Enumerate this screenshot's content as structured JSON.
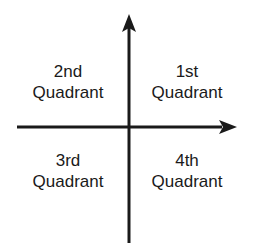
{
  "diagram": {
    "background_color": "#ffffff",
    "stroke_color": "#1a1a1a",
    "text_color": "#1a1a1a"
  },
  "axes": {
    "vertical": {
      "name": "y-axis",
      "arrow_direction": "up",
      "x": 129,
      "top": 14,
      "bottom": 243
    },
    "horizontal": {
      "name": "x-axis",
      "arrow_direction": "right",
      "y": 127,
      "left": 17,
      "right": 237
    },
    "origin": {
      "x": 129,
      "y": 127
    }
  },
  "quadrants": [
    {
      "id": "q1",
      "ordinal": "1st",
      "word": "Quadrant",
      "position": "top-right"
    },
    {
      "id": "q2",
      "ordinal": "2nd",
      "word": "Quadrant",
      "position": "top-left"
    },
    {
      "id": "q3",
      "ordinal": "3rd",
      "word": "Quadrant",
      "position": "bottom-left"
    },
    {
      "id": "q4",
      "ordinal": "4th",
      "word": "Quadrant",
      "position": "bottom-right"
    }
  ]
}
